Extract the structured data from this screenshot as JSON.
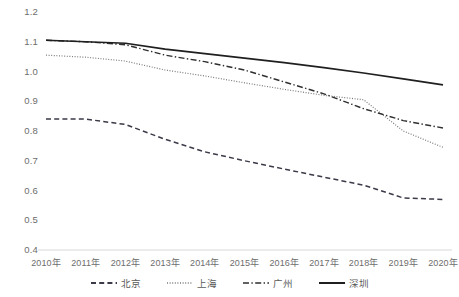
{
  "chart_data": {
    "type": "line",
    "title": "",
    "subtitle": "",
    "xlabel": "",
    "ylabel": "",
    "categories": [
      "2010年",
      "2011年",
      "2012年",
      "2013年",
      "2014年",
      "2015年",
      "2016年",
      "2017年",
      "2018年",
      "2019年",
      "2020年"
    ],
    "ylim": [
      0.4,
      1.2
    ],
    "ytick_labels": [
      "1.2",
      "1.1",
      "1.0",
      "0.9",
      "0.8",
      "0.7",
      "0.6",
      "0.5",
      "0.4"
    ],
    "ytick_values": [
      1.2,
      1.1,
      1.0,
      0.9,
      0.8,
      0.7,
      0.6,
      0.5,
      0.4
    ],
    "grid": false,
    "legend_position": "bottom",
    "series": [
      {
        "name": "北京",
        "style": "dashed",
        "color": "#3a3a48",
        "values": [
          0.84,
          0.84,
          0.822,
          0.772,
          0.73,
          0.7,
          0.672,
          0.645,
          0.618,
          0.575,
          0.57
        ]
      },
      {
        "name": "上海",
        "style": "dotted",
        "color": "#7a7a7a",
        "values": [
          1.055,
          1.048,
          1.035,
          1.005,
          0.985,
          0.962,
          0.94,
          0.92,
          0.905,
          0.8,
          0.745
        ]
      },
      {
        "name": "广州",
        "style": "dashdot",
        "color": "#2f2f2f",
        "values": [
          1.105,
          1.1,
          1.09,
          1.055,
          1.033,
          1.005,
          0.965,
          0.925,
          0.875,
          0.835,
          0.81
        ]
      },
      {
        "name": "深圳",
        "style": "solid",
        "color": "#1f1f1f",
        "values": [
          1.105,
          1.1,
          1.095,
          1.075,
          1.06,
          1.045,
          1.03,
          1.013,
          0.995,
          0.975,
          0.955
        ]
      }
    ]
  },
  "axis": {
    "baseline_color": "#d9d9d9"
  }
}
